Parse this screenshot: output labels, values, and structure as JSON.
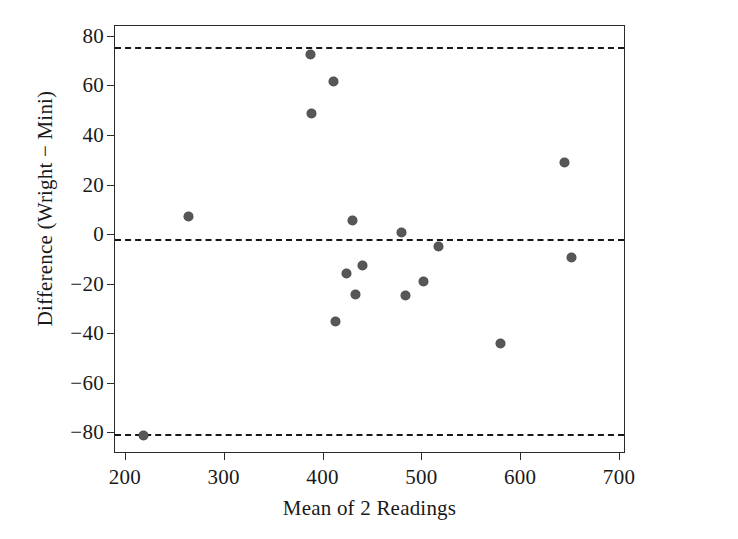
{
  "chart_data": {
    "type": "scatter",
    "title": "",
    "xlabel": "Mean of 2 Readings",
    "ylabel": "Difference (Wright − Mini)",
    "xlim": [
      190,
      705
    ],
    "ylim": [
      -88,
      84
    ],
    "grid": false,
    "legend": null,
    "xticks": [
      200,
      300,
      400,
      500,
      600,
      700
    ],
    "xtick_labels": [
      "200",
      "300",
      "400",
      "500",
      "600",
      "700"
    ],
    "yticks": [
      80,
      60,
      40,
      20,
      0,
      -20,
      -40,
      -60,
      -80
    ],
    "ytick_labels": [
      "80",
      "60",
      "40",
      "20",
      "0",
      "−20",
      "−40",
      "−60",
      "−80"
    ],
    "point_color": "#575757",
    "line_color": "#171717",
    "axis_color": "#2b2b2b",
    "reference_lines": [
      {
        "name": "upper-limit-of-agreement",
        "value": 75.6,
        "style": "dashed"
      },
      {
        "name": "mean-difference",
        "value": -2.2,
        "style": "dashed"
      },
      {
        "name": "lower-limit-of-agreement",
        "value": -80.8,
        "style": "dashed"
      }
    ],
    "points": [
      {
        "x": 219,
        "y": -81.5
      },
      {
        "x": 264,
        "y": 7.0
      },
      {
        "x": 388,
        "y": 72.5
      },
      {
        "x": 389,
        "y": 48.5
      },
      {
        "x": 411,
        "y": 61.5
      },
      {
        "x": 413,
        "y": -35.5
      },
      {
        "x": 424,
        "y": -16.0
      },
      {
        "x": 430,
        "y": 5.5
      },
      {
        "x": 433,
        "y": -24.5
      },
      {
        "x": 440,
        "y": -12.5
      },
      {
        "x": 480,
        "y": 0.8
      },
      {
        "x": 484,
        "y": -25.0
      },
      {
        "x": 502,
        "y": -19.0
      },
      {
        "x": 517,
        "y": -5.0
      },
      {
        "x": 580,
        "y": -44.0
      },
      {
        "x": 645,
        "y": 28.7
      },
      {
        "x": 652,
        "y": -9.4
      }
    ]
  }
}
